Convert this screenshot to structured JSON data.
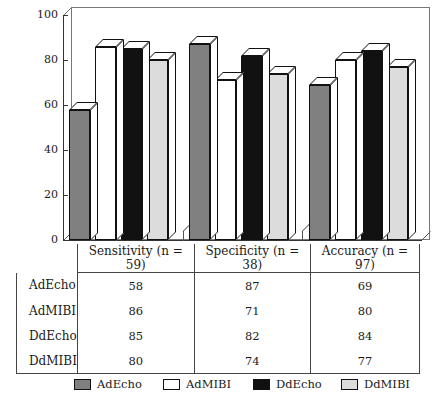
{
  "chart_data": {
    "type": "bar",
    "title": "",
    "xlabel": "",
    "ylabel": "",
    "ylim": [
      0,
      100
    ],
    "yticks": [
      0,
      20,
      40,
      60,
      80,
      100
    ],
    "grid": false,
    "legend_position": "bottom",
    "style": "3d-grouped-column",
    "categories": [
      "Sensitivity (n = 59)",
      "Specificity (n = 38)",
      "Accuracy (n = 97)"
    ],
    "series": [
      {
        "name": "AdEcho",
        "color": "#808080",
        "values": [
          58,
          87,
          69
        ]
      },
      {
        "name": "AdMIBI",
        "color": "#ffffff",
        "values": [
          86,
          71,
          80
        ]
      },
      {
        "name": "DdEcho",
        "color": "#111111",
        "values": [
          85,
          82,
          84
        ]
      },
      {
        "name": "DdMIBI",
        "color": "#dcdcdc",
        "values": [
          80,
          74,
          77
        ]
      }
    ]
  },
  "axis": {
    "tick_labels": [
      "100",
      "80",
      "60",
      "40",
      "20",
      "0"
    ]
  },
  "table": {
    "row_header_label": "",
    "column_headers": [
      "Sensitivity (n = 59)",
      "Specificity (n = 38)",
      "Accuracy (n = 97)"
    ],
    "rows": [
      {
        "label": "AdEcho",
        "values": [
          "58",
          "87",
          "69"
        ]
      },
      {
        "label": "AdMIBI",
        "values": [
          "86",
          "71",
          "80"
        ]
      },
      {
        "label": "DdEcho",
        "values": [
          "85",
          "82",
          "84"
        ]
      },
      {
        "label": "DdMIBI",
        "values": [
          "80",
          "74",
          "77"
        ]
      }
    ]
  },
  "legend": {
    "items": [
      {
        "label": "AdEcho",
        "color": "#808080"
      },
      {
        "label": "AdMIBI",
        "color": "#ffffff"
      },
      {
        "label": "DdEcho",
        "color": "#111111"
      },
      {
        "label": "DdMIBI",
        "color": "#dcdcdc"
      }
    ]
  }
}
